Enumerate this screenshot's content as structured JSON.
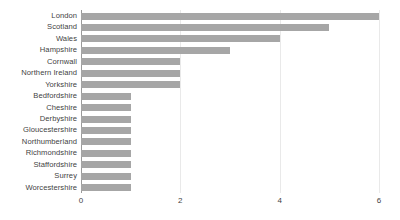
{
  "chart_data": {
    "type": "bar",
    "orientation": "horizontal",
    "title": "",
    "subtitle": "",
    "xlabel": "",
    "ylabel": "",
    "categories": [
      "London",
      "Scotland",
      "Wales",
      "Hampshire",
      "Cornwall",
      "Northern Ireland",
      "Yorkshire",
      "Bedfordshire",
      "Cheshire",
      "Derbyshire",
      "Gloucestershire",
      "Northumberland",
      "Richmondshire",
      "Staffordshire",
      "Surrey",
      "Worcestershire"
    ],
    "values": [
      6,
      5,
      4,
      3,
      2,
      2,
      2,
      1,
      1,
      1,
      1,
      1,
      1,
      1,
      1,
      1
    ],
    "xlim": [
      0,
      6
    ],
    "xticks": [
      0,
      2,
      4,
      6
    ],
    "xtick_labels": [
      "0",
      "2",
      "4",
      "6"
    ],
    "grid": true,
    "grid_axis": "x",
    "legend": false,
    "bar_color": "#a6a6a6",
    "grid_color": "#e9e9e9",
    "axis_color": "#9a9a9a",
    "text_color": "#3f3f3f",
    "background_color": "#ffffff"
  }
}
